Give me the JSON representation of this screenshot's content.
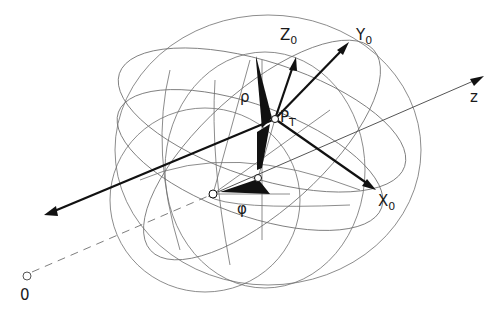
{
  "figure": {
    "type": "spherical-coordinate-diagram",
    "labels": {
      "origin": "0",
      "z_axis": "z",
      "x0_main": "X",
      "x0_sub": "0",
      "y0_main": "Y",
      "y0_sub": "0",
      "z0_main": "Z",
      "z0_sub": "0",
      "point_main": "P",
      "point_sub": "T",
      "rho": "ρ",
      "phi": "φ"
    },
    "colors": {
      "ink": "#111111",
      "thin_lines": "#6f6f6f",
      "background": "#ffffff"
    }
  }
}
